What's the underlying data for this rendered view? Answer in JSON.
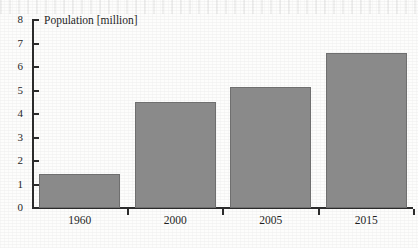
{
  "chart_data": {
    "type": "bar",
    "title": "Population [million]",
    "xlabel": "",
    "ylabel": "",
    "categories": [
      "1960",
      "2000",
      "2005",
      "2015"
    ],
    "values": [
      1.45,
      4.5,
      5.15,
      6.6
    ],
    "ylim": [
      0,
      8
    ],
    "yticks": [
      0,
      1,
      2,
      3,
      4,
      5,
      6,
      7,
      8
    ],
    "ytick_labels": [
      "0",
      "1",
      "2",
      "3",
      "4",
      "5",
      "6",
      "7",
      "8"
    ],
    "grid": false,
    "legend": null,
    "series": [
      {
        "name": "Population",
        "values": [
          1.45,
          4.5,
          5.15,
          6.6
        ]
      }
    ],
    "bar_color": "#8a8a8a",
    "bar_edge_color": "#6f6f6f",
    "axis_color": "#2b2b2b",
    "background_color": "#fdfdfc"
  }
}
